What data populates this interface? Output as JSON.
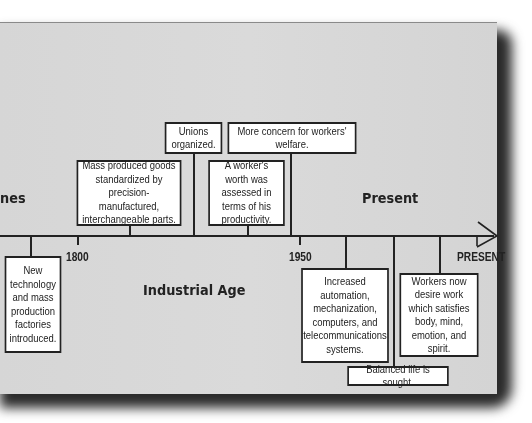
{
  "eras": {
    "left_partial": "nes",
    "industrial": "Industrial Age",
    "present": "Present"
  },
  "axis_labels": {
    "y1800": "1800",
    "y1950": "1950",
    "present": "PRESENT"
  },
  "events": {
    "new_technology": "New technology and mass production factories introduced.",
    "mass_produced": "Mass produced goods standardized by precision-manufactured, interchangeable parts.",
    "unions": "Unions organized.",
    "workers_worth": "A worker's worth was assessed in terms of his productivity.",
    "welfare": "More concern for workers' welfare.",
    "automation": "Increased automation, mechanization, computers, and telecommunications systems.",
    "balanced_life": "Balanced life is sought.",
    "workers_now": "Workers now desire work which satisfies body, mind, emotion, and spirit."
  },
  "colors": {
    "panel": "#d8d8d8",
    "line": "#222222",
    "box": "#ffffff",
    "shadow": "#2a2a2a"
  }
}
